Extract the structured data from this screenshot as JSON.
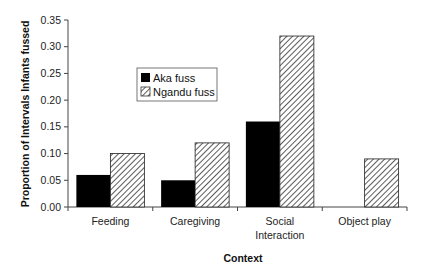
{
  "chart_data": {
    "type": "bar",
    "title": "",
    "xlabel": "Context",
    "ylabel": "Proportion of Intervals Infants fussed",
    "categories": [
      "Feeding",
      "Caregiving",
      "Social Interaction",
      "Object play"
    ],
    "category_lines": [
      [
        "Feeding"
      ],
      [
        "Caregiving"
      ],
      [
        "Social",
        "Interaction"
      ],
      [
        "Object play"
      ]
    ],
    "series": [
      {
        "name": "Aka fuss",
        "values": [
          0.06,
          0.05,
          0.16,
          0.0
        ],
        "fill": "solid",
        "color": "#000000"
      },
      {
        "name": "Ngandu fuss",
        "values": [
          0.1,
          0.12,
          0.32,
          0.09
        ],
        "fill": "hatched",
        "color": "#555555"
      }
    ],
    "ylim": [
      0,
      0.35
    ],
    "yticks": [
      "0.00",
      "0.05",
      "0.10",
      "0.15",
      "0.20",
      "0.25",
      "0.30",
      "0.35"
    ],
    "grid": false,
    "legend_position": "upper-left inside plot"
  },
  "legend": {
    "items": [
      {
        "label": "Aka fuss"
      },
      {
        "label": "Ngandu fuss"
      }
    ]
  }
}
